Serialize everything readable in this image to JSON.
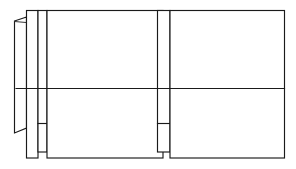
{
  "drawing": {
    "title": "Cabinet Elevation Line Drawing",
    "canvas": {
      "width": 296,
      "height": 169,
      "background_color": "#ffffff",
      "line_color": "#1a1a1a"
    },
    "description": "Monochrome technical line drawing: two large rectangular panels at right divided by a horizontal rail, with a stack of narrow vertical stiles and a thin slanted edge profile at the left.",
    "parts": [
      {
        "name": "edge-profile-sliver",
        "label": "Slanted edge profile",
        "shape": "quadrilateral",
        "points": "14,21 27,17 27,128 14,133"
      },
      {
        "name": "profile-top-tick",
        "label": "Profile top return",
        "shape": "polyline",
        "points": "14,21 26,22"
      },
      {
        "name": "outer-stile",
        "label": "Outer vertical stile",
        "shape": "rectangle",
        "x": 26,
        "y": 10,
        "w": 12,
        "h": 148
      },
      {
        "name": "inner-stile",
        "label": "Inner vertical stile",
        "shape": "rectangle",
        "x": 38,
        "y": 10,
        "w": 9,
        "h": 142
      },
      {
        "name": "inner-stile-rail-tick",
        "label": "Inner stile cross rail",
        "shape": "polyline",
        "points": "38,123 47,123"
      },
      {
        "name": "left-panel",
        "label": "Left door panel",
        "shape": "rectangle",
        "x": 47,
        "y": 10,
        "w": 116,
        "h": 148
      },
      {
        "name": "center-mullion",
        "label": "Center mullion strip",
        "shape": "rectangle",
        "x": 157,
        "y": 10,
        "w": 13,
        "h": 142
      },
      {
        "name": "center-mullion-rail-tick",
        "label": "Center mullion cross rail",
        "shape": "polyline",
        "points": "157,123 170,123"
      },
      {
        "name": "right-panel",
        "label": "Right door panel",
        "shape": "rectangle",
        "x": 170,
        "y": 10,
        "w": 115,
        "h": 148
      },
      {
        "name": "horizontal-rail",
        "label": "Horizontal divider rail",
        "shape": "polyline",
        "points": "16,88 285,88"
      }
    ],
    "geometry": {
      "top_edge_y": 10,
      "bottom_edge_y": 158,
      "rail_y": 88,
      "tick_y": 123,
      "left_extent_x": 14,
      "right_extent_x": 285,
      "panel_gap": {
        "from_x": 163,
        "to_x": 170
      }
    }
  }
}
